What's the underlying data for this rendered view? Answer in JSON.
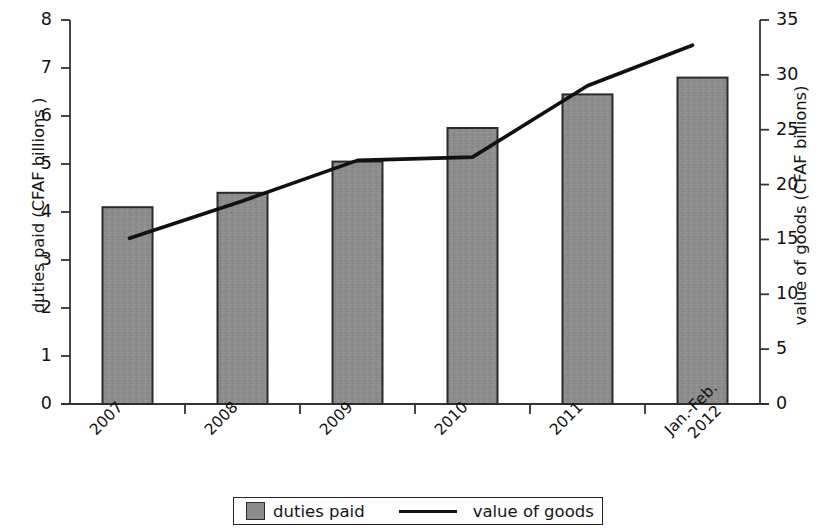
{
  "chart_data": {
    "type": "bar",
    "title": "",
    "subtitle": "",
    "xlabel": "",
    "ylabel": "duties paid (CFAF billions )",
    "y2label": "value of goods (CFAF billions)",
    "categories": [
      "2007",
      "2008",
      "2009",
      "2010",
      "2011",
      "Jan.-Feb.\n2012"
    ],
    "category_rotation_deg": -45,
    "grid": false,
    "legend_position": "bottom",
    "ylim": [
      0,
      8
    ],
    "y2lim": [
      0,
      35
    ],
    "yticks": [
      0,
      1,
      2,
      3,
      4,
      5,
      6,
      7,
      8
    ],
    "y2ticks": [
      0,
      5,
      10,
      15,
      20,
      25,
      30,
      35
    ],
    "ytick_labels": [
      "0",
      "1",
      "2",
      "3",
      "4",
      "5",
      "6",
      "7",
      "8"
    ],
    "y2tick_labels": [
      "0",
      "5",
      "10",
      "15",
      "20",
      "25",
      "30",
      "35"
    ],
    "series": [
      {
        "name": "duties paid",
        "type": "bar",
        "axis": "left",
        "color": "#8c8c8c",
        "edge_color": "#2b2b2b",
        "values": [
          4.1,
          4.4,
          5.05,
          5.75,
          6.45,
          6.8
        ]
      },
      {
        "name": "value of goods",
        "type": "line",
        "axis": "right",
        "color": "#111111",
        "values": [
          15.1,
          18.5,
          22.2,
          22.5,
          29.0,
          32.7
        ]
      }
    ]
  },
  "legend": {
    "bar_label": "duties paid",
    "line_label": "value of goods",
    "bar_swatch_color": "#8c8c8c",
    "line_swatch_color": "#111111"
  },
  "axes": {
    "left_title": "duties paid (CFAF billions )",
    "right_title": "value of goods (CFAF billions)",
    "axis_color": "#333333"
  }
}
